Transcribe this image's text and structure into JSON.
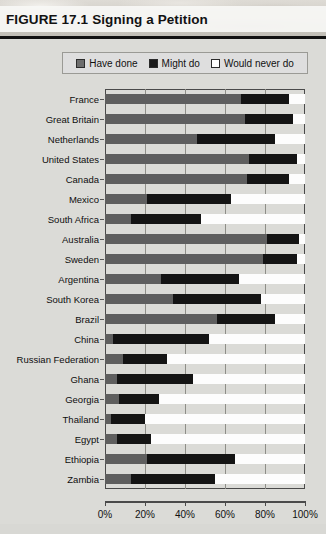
{
  "figure": {
    "number": "FIGURE 17.1",
    "title": "Signing a Petition"
  },
  "legend": {
    "items": [
      {
        "label": "Have done",
        "color": "#6d6d6d",
        "icon": "square-swatch-gray"
      },
      {
        "label": "Might do",
        "color": "#1a1a1a",
        "icon": "square-swatch-black"
      },
      {
        "label": "Would never do",
        "color": "#ffffff",
        "icon": "square-swatch-white"
      }
    ]
  },
  "chart_data": {
    "type": "bar",
    "orientation": "horizontal",
    "stacked": true,
    "stack_total": 100,
    "title": "Signing a Petition",
    "xlabel": "",
    "ylabel": "",
    "xlim": [
      0,
      100
    ],
    "xticks": [
      0,
      20,
      40,
      60,
      80,
      100
    ],
    "xticklabels": [
      "0%",
      "20%",
      "40%",
      "60%",
      "80%",
      "100%"
    ],
    "grid": "vertical",
    "legend_position": "top",
    "categories": [
      "France",
      "Great Britain",
      "Netherlands",
      "United States",
      "Canada",
      "Mexico",
      "South Africa",
      "Australia",
      "Sweden",
      "Argentina",
      "South Korea",
      "Brazil",
      "China",
      "Russian Federation",
      "Ghana",
      "Georgia",
      "Thailand",
      "Egypt",
      "Ethiopia",
      "Zambia"
    ],
    "series": [
      {
        "name": "Have done",
        "color": "#5e5e5e",
        "values": [
          68,
          70,
          46,
          72,
          71,
          21,
          13,
          81,
          79,
          28,
          34,
          56,
          4,
          9,
          6,
          7,
          3,
          6,
          21,
          13
        ]
      },
      {
        "name": "Might do",
        "color": "#141414",
        "values": [
          24,
          24,
          39,
          24,
          21,
          42,
          35,
          16,
          17,
          39,
          44,
          29,
          48,
          22,
          38,
          20,
          17,
          17,
          44,
          42
        ]
      },
      {
        "name": "Would never do",
        "color": "#fdfdfd",
        "values": [
          8,
          6,
          15,
          4,
          8,
          37,
          52,
          3,
          4,
          33,
          22,
          15,
          48,
          69,
          56,
          73,
          80,
          77,
          35,
          45
        ]
      }
    ]
  }
}
